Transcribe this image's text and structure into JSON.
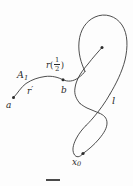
{
  "figure": {
    "kind": "mathematical-diagram",
    "background_color": "#fdfdfd",
    "stroke_color": "#3a3a3a",
    "labels": {
      "start_point": "a",
      "arc_segment": "A",
      "arc_segment_subscript": "1",
      "path_lower": "r",
      "path_lower_prime": "′",
      "mid_point": "b",
      "param_point_fn": "r",
      "param_point_numerator": "1",
      "param_point_denominator": "2",
      "param_open_paren": "(",
      "param_close_paren": ")",
      "loop_label": "l",
      "end_point": "x",
      "end_point_subscript": "0"
    },
    "points": [
      {
        "name": "a",
        "x": 13,
        "y": 98
      },
      {
        "name": "b",
        "x": 63,
        "y": 80
      },
      {
        "name": "r-half-endpoint",
        "x": 102,
        "y": 47
      },
      {
        "name": "x0",
        "x": 83,
        "y": 153
      }
    ]
  }
}
